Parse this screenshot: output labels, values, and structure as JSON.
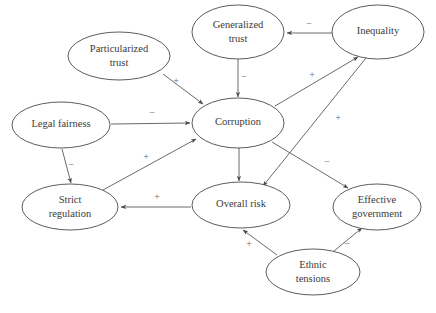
{
  "diagram": {
    "background_color": "#ffffff",
    "node_stroke_color": "#4a4a4a",
    "edge_stroke_color": "#5a5a5a",
    "label_color": "#3a3a3a",
    "sign_color": "#6a6a6a"
  },
  "nodes": [
    {
      "id": "particularized_trust",
      "label_line1": "Particularized",
      "label_line2": "trust",
      "cx": 119,
      "cy": 56,
      "rx": 51,
      "ry": 24
    },
    {
      "id": "generalized_trust",
      "label_line1": "Generalized",
      "label_line2": "trust",
      "cx": 238,
      "cy": 32,
      "rx": 46,
      "ry": 27
    },
    {
      "id": "inequality",
      "label_line1": "Inequality",
      "label_line2": "",
      "cx": 378,
      "cy": 32,
      "rx": 46,
      "ry": 27
    },
    {
      "id": "legal_fairness",
      "label_line1": "Legal fairness",
      "label_line2": "",
      "cx": 61,
      "cy": 125,
      "rx": 49,
      "ry": 23
    },
    {
      "id": "corruption",
      "label_line1": "Corruption",
      "label_line2": "",
      "cx": 238,
      "cy": 123,
      "rx": 46,
      "ry": 25
    },
    {
      "id": "strict_regulation",
      "label_line1": "Strict",
      "label_line2": "regulation",
      "cx": 70,
      "cy": 207,
      "rx": 48,
      "ry": 23
    },
    {
      "id": "overall_risk",
      "label_line1": "Overall risk",
      "label_line2": "",
      "cx": 241,
      "cy": 205,
      "rx": 49,
      "ry": 23
    },
    {
      "id": "effective_government",
      "label_line1": "Effective",
      "label_line2": "government",
      "cx": 377,
      "cy": 207,
      "rx": 44,
      "ry": 23
    },
    {
      "id": "ethnic_tensions",
      "label_line1": "Ethnic",
      "label_line2": "tensions",
      "cx": 313,
      "cy": 272,
      "rx": 47,
      "ry": 23
    }
  ],
  "edges": [
    {
      "id": "particularized_trust-to-corruption",
      "from": "particularized_trust",
      "to": "corruption",
      "sign": "+",
      "x1": 163,
      "y1": 74,
      "x2": 203,
      "y2": 104,
      "sx": 176,
      "sy": 82
    },
    {
      "id": "generalized_trust-to-corruption",
      "from": "generalized_trust",
      "to": "corruption",
      "sign": "−",
      "x1": 238,
      "y1": 59,
      "x2": 238,
      "y2": 97,
      "sx": 244,
      "sy": 78
    },
    {
      "id": "inequality-to-generalized_trust",
      "from": "inequality",
      "to": "generalized_trust",
      "sign": "−",
      "x1": 332,
      "y1": 33,
      "x2": 287,
      "y2": 33,
      "sx": 309,
      "sy": 25
    },
    {
      "id": "legal_fairness-to-corruption",
      "from": "legal_fairness",
      "to": "corruption",
      "sign": "−",
      "x1": 111,
      "y1": 124,
      "x2": 190,
      "y2": 123,
      "sx": 152,
      "sy": 114
    },
    {
      "id": "legal_fairness-to-strict_regulation",
      "from": "legal_fairness",
      "to": "strict_regulation",
      "sign": "−",
      "x1": 62,
      "y1": 149,
      "x2": 71,
      "y2": 183,
      "sx": 71,
      "sy": 166
    },
    {
      "id": "strict_regulation-to-corruption",
      "from": "strict_regulation",
      "to": "corruption",
      "sign": "+",
      "x1": 103,
      "y1": 190,
      "x2": 196,
      "y2": 139,
      "sx": 146,
      "sy": 158
    },
    {
      "id": "corruption-to-inequality",
      "from": "corruption",
      "to": "inequality",
      "sign": "+",
      "x1": 275,
      "y1": 106,
      "x2": 358,
      "y2": 57,
      "sx": 312,
      "sy": 76
    },
    {
      "id": "corruption-to-overall_risk",
      "from": "corruption",
      "to": "overall_risk",
      "sign": "",
      "x1": 239,
      "y1": 148,
      "x2": 239,
      "y2": 181,
      "sx": 0,
      "sy": 0
    },
    {
      "id": "corruption-to-effective_government",
      "from": "corruption",
      "to": "effective_government",
      "sign": "−",
      "x1": 272,
      "y1": 142,
      "x2": 348,
      "y2": 188,
      "sx": 327,
      "sy": 163
    },
    {
      "id": "inequality-to-overall_risk",
      "from": "inequality",
      "to": "overall_risk",
      "sign": "+",
      "x1": 366,
      "y1": 58,
      "x2": 263,
      "y2": 186,
      "sx": 338,
      "sy": 119
    },
    {
      "id": "overall_risk-to-strict_regulation",
      "from": "overall_risk",
      "to": "strict_regulation",
      "sign": "+",
      "x1": 191,
      "y1": 207,
      "x2": 121,
      "y2": 207,
      "sx": 157,
      "sy": 198
    },
    {
      "id": "ethnic_tensions-to-overall_risk",
      "from": "ethnic_tensions",
      "to": "overall_risk",
      "sign": "+",
      "x1": 277,
      "y1": 255,
      "x2": 243,
      "y2": 230,
      "sx": 249,
      "sy": 245
    },
    {
      "id": "ethnic_tensions-to-effective_government",
      "from": "ethnic_tensions",
      "to": "effective_government",
      "sign": "−",
      "x1": 334,
      "y1": 251,
      "x2": 362,
      "y2": 228,
      "sx": 347,
      "sy": 245
    }
  ]
}
